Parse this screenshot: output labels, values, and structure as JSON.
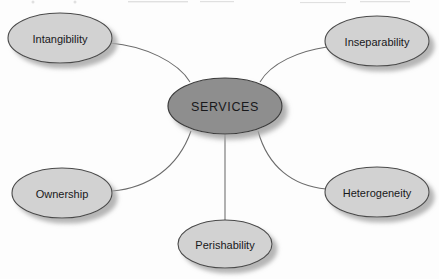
{
  "diagram": {
    "type": "hub-and-spoke",
    "background_color": "#fdfdfd",
    "hub": {
      "label": "SERVICES",
      "fill": "#8e8e8e",
      "stroke": "#3b3b3b",
      "cx": 225,
      "cy": 106,
      "rx": 57,
      "ry": 28
    },
    "satellite_style": {
      "fill": "#d2d2d2",
      "stroke": "#4a4a4a",
      "shadow": "#b6b6b6"
    },
    "connector_color": "#6b6b6b",
    "satellites": [
      {
        "id": "intangibility",
        "label": "Intangibility",
        "cx": 60,
        "cy": 38,
        "rx": 52,
        "ry": 25,
        "connector": "curved"
      },
      {
        "id": "inseparability",
        "label": "Inseparability",
        "cx": 377,
        "cy": 41,
        "rx": 52,
        "ry": 25,
        "connector": "curved"
      },
      {
        "id": "ownership",
        "label": "Ownership",
        "cx": 62,
        "cy": 193,
        "rx": 50,
        "ry": 25,
        "connector": "curved"
      },
      {
        "id": "heterogeneity",
        "label": "Heterogeneity",
        "cx": 377,
        "cy": 192,
        "rx": 52,
        "ry": 25,
        "connector": "curved"
      },
      {
        "id": "perishability",
        "label": "Perishability",
        "cx": 225,
        "cy": 244,
        "rx": 47,
        "ry": 24,
        "connector": "straight"
      }
    ]
  }
}
